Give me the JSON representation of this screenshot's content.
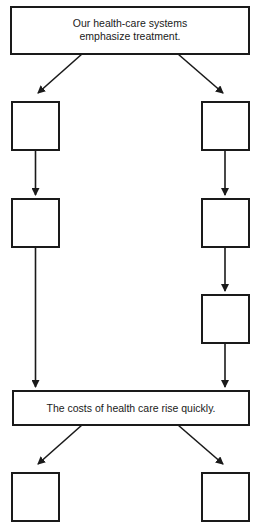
{
  "diagram": {
    "top_box": {
      "line1": "Our health-care systems",
      "line2": "emphasize treatment."
    },
    "middle_box": {
      "text": "The costs of health care rise quickly."
    },
    "left_chain": [
      {
        "text": ""
      },
      {
        "text": ""
      }
    ],
    "right_chain": [
      {
        "text": ""
      },
      {
        "text": ""
      },
      {
        "text": ""
      }
    ],
    "bottom_boxes": [
      {
        "text": ""
      },
      {
        "text": ""
      }
    ],
    "colors": {
      "stroke": "#1a1a1a",
      "background": "#ffffff"
    }
  }
}
